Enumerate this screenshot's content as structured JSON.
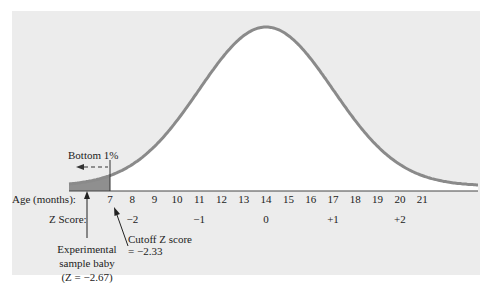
{
  "chart_data": {
    "type": "area",
    "title": "",
    "distribution": "normal",
    "mean_age_months": 14,
    "sd_age_months": 3,
    "xlabel": "Age (months):",
    "zlabel": "Z Score:",
    "age_ticks": [
      7,
      8,
      9,
      10,
      11,
      12,
      13,
      14,
      15,
      16,
      17,
      18,
      19,
      20,
      21
    ],
    "z_ticks": [
      {
        "z": -2,
        "age": 8,
        "label": "−2"
      },
      {
        "z": -1,
        "age": 11,
        "label": "−1"
      },
      {
        "z": 0,
        "age": 14,
        "label": "0"
      },
      {
        "z": 1,
        "age": 17,
        "label": "+1"
      },
      {
        "z": 2,
        "age": 20,
        "label": "+2"
      }
    ],
    "shaded_region": {
      "label": "Bottom 1%",
      "to_age": 7,
      "z_cutoff": -2.33
    },
    "annotations": [
      {
        "name": "experimental-baby",
        "lines": [
          "Experimental",
          "sample baby",
          "(Z = −2.67)"
        ],
        "z": -2.67
      },
      {
        "name": "cutoff",
        "lines": [
          "Cutoff Z score",
          "= −2.33"
        ],
        "z": -2.33
      }
    ],
    "colors": {
      "curve": "#8a8a8a",
      "shade": "#8f8f8f",
      "panel": "#ececec",
      "fill_under": "#ffffff",
      "axis": "#444444"
    }
  }
}
